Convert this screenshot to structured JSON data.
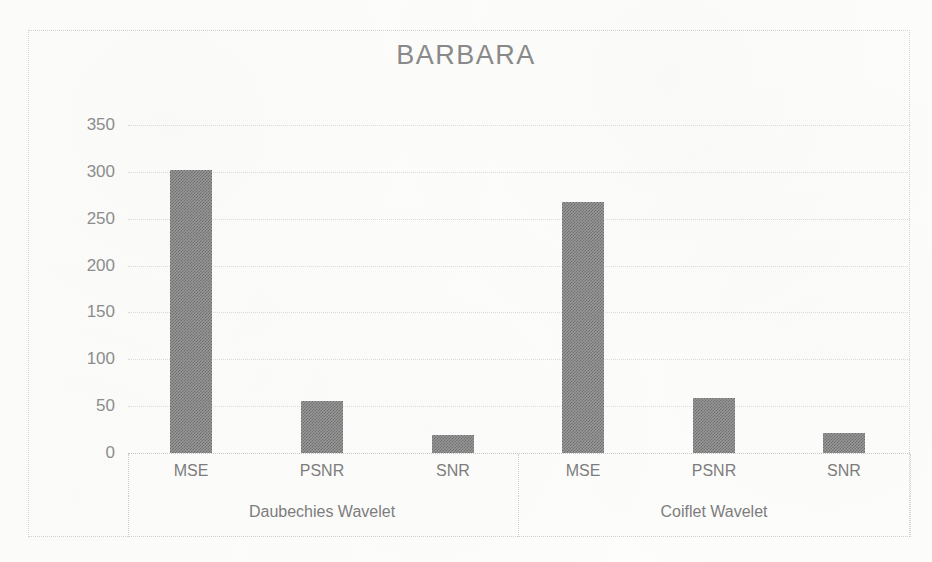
{
  "chart_data": {
    "type": "bar",
    "title": "BARBARA",
    "xlabel": "",
    "ylabel": "",
    "ylim": [
      0,
      350
    ],
    "y_ticks": [
      0,
      50,
      100,
      150,
      200,
      250,
      300,
      350
    ],
    "grid": true,
    "legend": "none",
    "categories": [
      "MSE",
      "PSNR",
      "SNR"
    ],
    "groups": [
      "Daubechies Wavelet",
      "Coiflet Wavelet"
    ],
    "series": [
      {
        "name": "Daubechies Wavelet",
        "values": [
          302,
          55,
          19
        ]
      },
      {
        "name": "Coiflet Wavelet",
        "values": [
          268,
          59,
          21
        ]
      }
    ],
    "bar_color": "#808080",
    "bar_pattern": "checkered-dither",
    "background_color": "#fdfdfc",
    "axis_text_color": "#8a8a8a"
  },
  "chart": {
    "title": "BARBARA",
    "y_axis": {
      "ticks": [
        "350",
        "300",
        "250",
        "200",
        "150",
        "100",
        "50",
        "0"
      ]
    },
    "x_axis": {
      "category_labels": [
        "MSE",
        "PSNR",
        "SNR",
        "MSE",
        "PSNR",
        "SNR"
      ],
      "group_labels": [
        "Daubechies Wavelet",
        "Coiflet Wavelet"
      ]
    },
    "bars": [
      {
        "label": "MSE",
        "group": "Daubechies Wavelet",
        "value": 302
      },
      {
        "label": "PSNR",
        "group": "Daubechies Wavelet",
        "value": 55
      },
      {
        "label": "SNR",
        "group": "Daubechies Wavelet",
        "value": 19
      },
      {
        "label": "MSE",
        "group": "Coiflet Wavelet",
        "value": 268
      },
      {
        "label": "PSNR",
        "group": "Coiflet Wavelet",
        "value": 59
      },
      {
        "label": "SNR",
        "group": "Coiflet Wavelet",
        "value": 21
      }
    ]
  }
}
